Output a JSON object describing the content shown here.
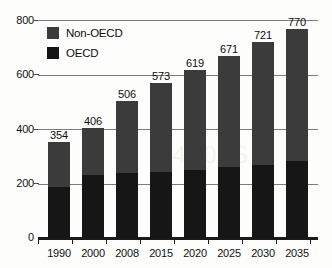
{
  "chart_data": {
    "type": "bar",
    "subtype": "stacked-bar",
    "title": "",
    "xlabel": "",
    "ylabel": "",
    "ylim": [
      0,
      800
    ],
    "yticks": [
      0,
      200,
      400,
      600,
      800
    ],
    "grid": true,
    "legend_position": "top-left inside plot",
    "categories": [
      "1990",
      "2000",
      "2008",
      "2015",
      "2020",
      "2025",
      "2030",
      "2035"
    ],
    "series": [
      {
        "name": "OECD",
        "color": "#161616",
        "values": [
          187,
          232,
          238,
          245,
          250,
          262,
          268,
          283
        ]
      },
      {
        "name": "Non-OECD",
        "color": "#3b3b3b",
        "values": [
          167,
          174,
          268,
          328,
          369,
          409,
          453,
          487
        ]
      }
    ],
    "totals": [
      354,
      406,
      506,
      573,
      619,
      671,
      721,
      770
    ],
    "total_labels": [
      "354",
      "406",
      "506",
      "573",
      "619",
      "671",
      "721",
      "770"
    ],
    "ytick_labels": [
      "0",
      "200",
      "400",
      "600",
      "800"
    ]
  },
  "legend": {
    "items": [
      {
        "label": "Non-OECD",
        "color": "#3b3b3b"
      },
      {
        "label": "OECD",
        "color": "#141416"
      }
    ]
  },
  "ghost": "354 406 506"
}
